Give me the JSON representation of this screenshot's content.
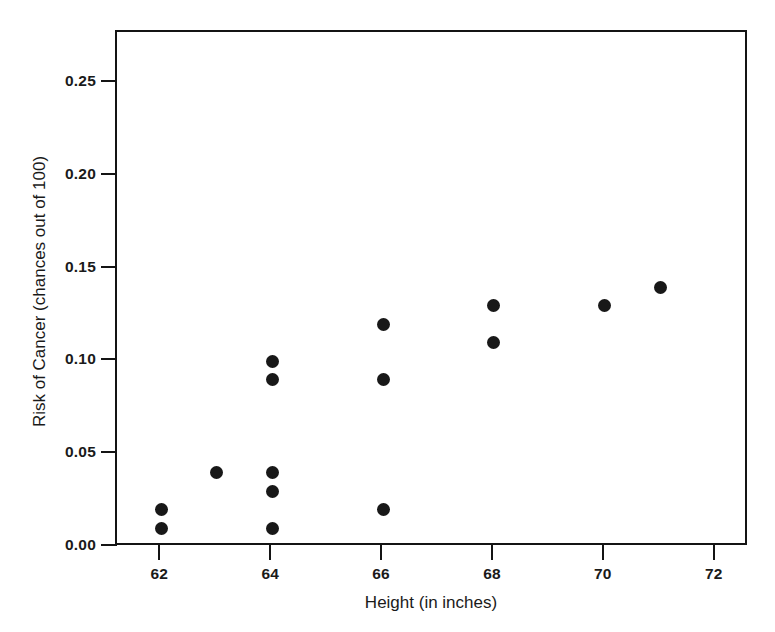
{
  "chart_data": {
    "type": "scatter",
    "title": "",
    "xlabel": "Height (in inches)",
    "ylabel": "Risk of Cancer (chances out of 100)",
    "xlim": [
      61.2,
      72.6
    ],
    "ylim": [
      0.0,
      0.2775
    ],
    "xticks": [
      "62",
      "64",
      "66",
      "68",
      "70",
      "72"
    ],
    "xtick_values": [
      62,
      64,
      66,
      68,
      70,
      72
    ],
    "yticks": [
      "0.00",
      "0.05",
      "0.10",
      "0.15",
      "0.20",
      "0.25"
    ],
    "ytick_values": [
      0.0,
      0.05,
      0.1,
      0.15,
      0.2,
      0.25
    ],
    "grid": false,
    "legend": "none",
    "marker": "filled-circle",
    "marker_color": "#181818",
    "x": [
      62,
      62,
      63,
      64,
      64,
      64,
      64,
      64,
      66,
      66,
      66,
      68,
      68,
      70,
      71
    ],
    "y": [
      0.02,
      0.01,
      0.04,
      0.1,
      0.09,
      0.04,
      0.03,
      0.01,
      0.12,
      0.09,
      0.02,
      0.13,
      0.11,
      0.13,
      0.14
    ],
    "points": [
      {
        "x": 62,
        "y": 0.02
      },
      {
        "x": 62,
        "y": 0.01
      },
      {
        "x": 63,
        "y": 0.04
      },
      {
        "x": 64,
        "y": 0.1
      },
      {
        "x": 64,
        "y": 0.09
      },
      {
        "x": 64,
        "y": 0.04
      },
      {
        "x": 64,
        "y": 0.03
      },
      {
        "x": 64,
        "y": 0.01
      },
      {
        "x": 66,
        "y": 0.12
      },
      {
        "x": 66,
        "y": 0.09
      },
      {
        "x": 66,
        "y": 0.02
      },
      {
        "x": 68,
        "y": 0.13
      },
      {
        "x": 68,
        "y": 0.11
      },
      {
        "x": 70,
        "y": 0.13
      },
      {
        "x": 71,
        "y": 0.14
      }
    ]
  }
}
